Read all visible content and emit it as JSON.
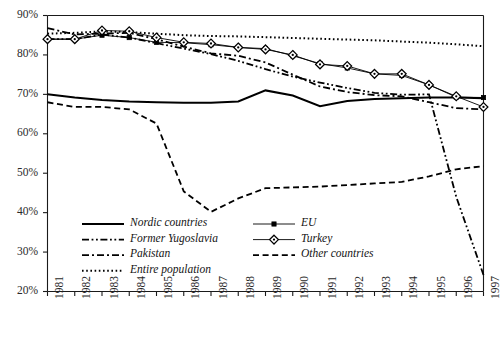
{
  "chart_data": {
    "type": "line",
    "title": "",
    "xlabel": "",
    "ylabel": "",
    "grid": false,
    "legend_position": "inside-bottom-left",
    "x": [
      1981,
      1982,
      1983,
      1984,
      1985,
      1986,
      1987,
      1988,
      1989,
      1990,
      1991,
      1992,
      1993,
      1994,
      1995,
      1996,
      1997
    ],
    "xlim": [
      1981,
      1997
    ],
    "ylim": [
      20,
      90
    ],
    "yticks": [
      20,
      30,
      40,
      50,
      60,
      70,
      80,
      90
    ],
    "ytick_labels": [
      "20%",
      "30%",
      "40%",
      "50%",
      "60%",
      "70%",
      "80%",
      "90%"
    ],
    "xtick_labels": [
      "1981",
      "1982",
      "1983",
      "1984",
      "1985",
      "1986",
      "1987",
      "1988",
      "1989",
      "1990",
      "1991",
      "1992",
      "1993",
      "1994",
      "1995",
      "1996",
      "1997"
    ],
    "series": [
      {
        "name": "Nordic countries",
        "style": "solid",
        "marker": "none",
        "color": "#000000",
        "width": 2.0,
        "values": [
          70.0,
          69.2,
          68.6,
          68.2,
          68.0,
          67.9,
          67.9,
          68.2,
          71.0,
          69.7,
          67.0,
          68.3,
          68.8,
          69.0,
          69.2,
          69.2,
          69.0
        ]
      },
      {
        "name": "Former Yugoslavia",
        "style": "dash-dot-dot",
        "marker": "none",
        "color": "#000000",
        "width": 1.8,
        "values": [
          84.0,
          84.0,
          85.2,
          84.4,
          83.0,
          81.6,
          80.2,
          78.5,
          76.4,
          74.5,
          73.0,
          71.6,
          70.4,
          69.9,
          70.0,
          44.0,
          24.2
        ]
      },
      {
        "name": "Pakistan",
        "style": "dash-dot",
        "marker": "none",
        "color": "#000000",
        "width": 1.8,
        "values": [
          86.8,
          85.2,
          85.4,
          85.6,
          84.0,
          82.1,
          80.4,
          79.8,
          78.1,
          75.0,
          72.0,
          70.6,
          69.8,
          69.5,
          68.0,
          66.5,
          66.2
        ]
      },
      {
        "name": "Entire population",
        "style": "dotted",
        "marker": "none",
        "color": "#000000",
        "width": 2.0,
        "values": [
          85.4,
          85.6,
          86.0,
          85.8,
          85.4,
          85.0,
          84.8,
          84.7,
          84.5,
          84.3,
          84.1,
          83.9,
          83.7,
          83.4,
          83.1,
          82.7,
          82.2
        ]
      },
      {
        "name": "EU",
        "style": "solid",
        "marker": "square",
        "color": "#000000",
        "width": 0.9,
        "values": [
          84.0,
          84.0,
          85.0,
          84.4,
          83.2,
          83.1,
          82.6,
          81.9,
          81.6,
          79.8,
          77.8,
          76.7,
          75.2,
          74.8,
          72.4,
          69.3,
          69.2
        ]
      },
      {
        "name": "Turkey",
        "style": "solid",
        "marker": "diamond",
        "color": "#000000",
        "width": 0.9,
        "values": [
          84.0,
          84.0,
          86.2,
          86.0,
          84.4,
          83.2,
          82.9,
          81.9,
          81.4,
          80.0,
          77.6,
          77.2,
          75.2,
          75.2,
          72.4,
          69.5,
          66.8
        ]
      },
      {
        "name": "Other countries",
        "style": "dashed",
        "marker": "none",
        "color": "#000000",
        "width": 1.8,
        "values": [
          68.0,
          66.8,
          66.8,
          66.2,
          62.6,
          45.4,
          40.2,
          43.6,
          46.2,
          46.4,
          46.6,
          47.0,
          47.4,
          47.8,
          49.2,
          51.0,
          51.8
        ]
      }
    ]
  },
  "legend": {
    "left_column": [
      {
        "label": "Nordic countries",
        "series": "Nordic countries"
      },
      {
        "label": "Former Yugoslavia",
        "series": "Former Yugoslavia"
      },
      {
        "label": "Pakistan",
        "series": "Pakistan"
      },
      {
        "label": "Entire population",
        "series": "Entire population"
      }
    ],
    "right_column": [
      {
        "label": "EU",
        "series": "EU"
      },
      {
        "label": "Turkey",
        "series": "Turkey"
      },
      {
        "label": "Other countries",
        "series": "Other countries"
      }
    ]
  }
}
